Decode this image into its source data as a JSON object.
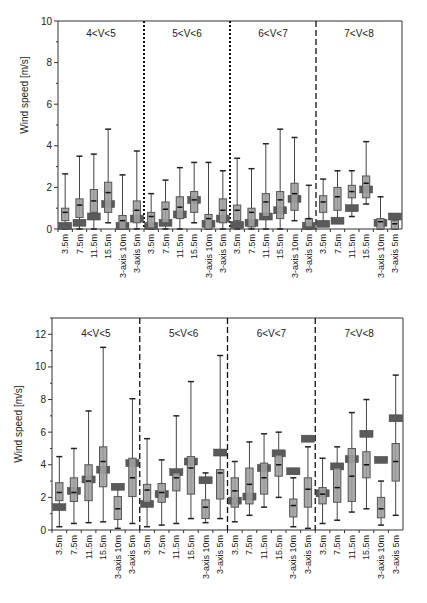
{
  "chart_data": [
    {
      "type": "box",
      "title": "",
      "xlabel": "",
      "ylabel": "Wind speed [m/s]",
      "ylim": [
        0,
        10
      ],
      "yticks": [
        0,
        2,
        4,
        6,
        8,
        10
      ],
      "grid": false,
      "groups": [
        "4<V<5",
        "5<V<6",
        "6<V<7",
        "7<V<8"
      ],
      "categories": [
        "3.5m",
        "7.5m",
        "11.5m",
        "15.5m",
        "3-axis 10m",
        "3-axis 5m"
      ],
      "series": [
        {
          "name": "distribution",
          "description": "light gray boxes: whisker min, q1, median, q3, whisker max",
          "boxes": [
            [
              0.0,
              0.4,
              0.8,
              1.0,
              2.65
            ],
            [
              0.0,
              0.55,
              1.15,
              1.45,
              3.5
            ],
            [
              0.0,
              0.8,
              1.35,
              1.9,
              3.6
            ],
            [
              0.3,
              0.8,
              1.75,
              2.25,
              4.8
            ],
            [
              0.0,
              0.0,
              0.4,
              0.65,
              2.6
            ],
            [
              0.0,
              0.3,
              0.9,
              1.35,
              3.75
            ],
            [
              0.0,
              0.05,
              0.6,
              0.8,
              1.7
            ],
            [
              0.0,
              0.3,
              0.95,
              1.3,
              2.35
            ],
            [
              0.0,
              0.5,
              1.05,
              1.55,
              2.95
            ],
            [
              0.3,
              0.8,
              1.4,
              1.8,
              3.2
            ],
            [
              0.0,
              0.0,
              0.5,
              0.7,
              3.2
            ],
            [
              0.0,
              0.3,
              0.9,
              1.45,
              2.8
            ],
            [
              0.0,
              0.4,
              0.9,
              1.15,
              3.4
            ],
            [
              0.0,
              0.1,
              0.8,
              1.0,
              2.9
            ],
            [
              0.0,
              0.6,
              1.3,
              1.7,
              4.1
            ],
            [
              0.0,
              0.5,
              1.4,
              1.8,
              4.8
            ],
            [
              0.4,
              0.9,
              1.7,
              2.2,
              4.4
            ],
            [
              0.0,
              0.1,
              0.5,
              0.5,
              2.1
            ],
            [
              0.3,
              0.8,
              1.3,
              1.6,
              2.4
            ],
            [
              0.3,
              0.9,
              1.55,
              2.0,
              2.8
            ],
            [
              0.6,
              1.5,
              1.8,
              2.1,
              2.8
            ],
            [
              1.2,
              1.5,
              2.2,
              2.55,
              4.2
            ],
            [
              0.0,
              0.0,
              0.35,
              0.5,
              1.55
            ],
            [
              0.0,
              0.0,
              0.25,
              0.4,
              0.65
            ]
          ]
        },
        {
          "name": "reference",
          "description": "dark gray rectangles (mean marker)",
          "values": [
            0.15,
            0.3,
            0.6,
            1.2,
            0.15,
            0.5,
            0.15,
            0.3,
            0.7,
            1.4,
            0.25,
            0.5,
            0.2,
            0.3,
            0.6,
            0.9,
            1.45,
            0.15,
            0.25,
            0.4,
            1.0,
            1.9,
            0.3,
            0.6
          ]
        }
      ]
    },
    {
      "type": "box",
      "title": "",
      "xlabel": "",
      "ylabel": "Wind speed [m/s]",
      "ylim": [
        0,
        13
      ],
      "yticks": [
        0,
        2,
        4,
        6,
        8,
        10,
        12
      ],
      "grid": false,
      "groups": [
        "4<V<5",
        "5<V<6",
        "6<V<7",
        "7<V<8"
      ],
      "categories": [
        "3.5m",
        "7.5m",
        "11.5m",
        "15.5m",
        "3-axis 10m",
        "3-axis 5m"
      ],
      "series": [
        {
          "name": "distribution",
          "description": "light gray boxes: whisker min, q1, median, q3, whisker max",
          "boxes": [
            [
              0.2,
              1.8,
              2.3,
              2.9,
              4.5
            ],
            [
              0.4,
              1.75,
              2.3,
              3.2,
              5.0
            ],
            [
              0.45,
              1.8,
              3.0,
              4.0,
              7.3
            ],
            [
              0.5,
              2.65,
              4.2,
              5.1,
              11.2
            ],
            [
              0.1,
              0.65,
              1.3,
              2.05,
              2.6
            ],
            [
              0.4,
              2.05,
              3.2,
              4.4,
              8.05
            ],
            [
              0.2,
              1.7,
              2.45,
              2.8,
              5.6
            ],
            [
              0.3,
              1.7,
              2.3,
              2.85,
              4.3
            ],
            [
              0.4,
              2.4,
              3.2,
              3.5,
              7.0
            ],
            [
              0.7,
              2.2,
              3.8,
              4.5,
              9.1
            ],
            [
              0.45,
              0.7,
              1.4,
              1.85,
              3.5
            ],
            [
              0.7,
              1.9,
              3.5,
              3.7,
              10.7
            ],
            [
              0.5,
              1.4,
              2.4,
              3.2,
              4.2
            ],
            [
              0.9,
              1.6,
              2.8,
              3.8,
              5.4
            ],
            [
              1.4,
              2.2,
              3.2,
              4.1,
              5.9
            ],
            [
              2.0,
              3.3,
              4.0,
              4.6,
              6.0
            ],
            [
              0.2,
              0.8,
              1.5,
              1.9,
              3.2
            ],
            [
              0.1,
              1.4,
              2.5,
              3.2,
              5.1
            ],
            [
              0.4,
              1.6,
              2.2,
              2.6,
              4.4
            ],
            [
              0.6,
              1.7,
              2.6,
              3.8,
              5.1
            ],
            [
              1.1,
              1.75,
              3.3,
              5.0,
              7.2
            ],
            [
              1.3,
              3.2,
              4.0,
              4.8,
              8.0
            ],
            [
              0.3,
              0.75,
              1.3,
              2.0,
              3.0
            ],
            [
              0.9,
              3.0,
              4.2,
              5.3,
              9.5
            ]
          ]
        },
        {
          "name": "reference",
          "description": "dark gray rectangles (mean marker)",
          "values": [
            1.4,
            2.4,
            3.1,
            3.7,
            2.65,
            4.1,
            1.6,
            2.2,
            3.55,
            4.2,
            3.05,
            4.75,
            1.8,
            2.05,
            3.8,
            4.7,
            3.6,
            5.6,
            2.25,
            3.9,
            4.35,
            5.9,
            4.3,
            6.85
          ]
        }
      ]
    }
  ],
  "charts": [
    {
      "ylabel": "Wind speed [m/s]",
      "yticks": [
        "0",
        "2",
        "4",
        "6",
        "8",
        "10"
      ],
      "groups": [
        "4<V<5",
        "5<V<6",
        "6<V<7",
        "7<V<8"
      ],
      "categories": [
        "3.5m",
        "7.5m",
        "11.5m",
        "15.5m",
        "3-axis 10m",
        "3-axis 5m"
      ]
    },
    {
      "ylabel": "Wind speed [m/s]",
      "yticks": [
        "0",
        "2",
        "4",
        "6",
        "8",
        "10",
        "12"
      ],
      "groups": [
        "4<V<5",
        "5<V<6",
        "6<V<7",
        "7<V<8"
      ],
      "categories": [
        "3.5m",
        "7.5m",
        "11.5m",
        "15.5m",
        "3-axis 10m",
        "3-axis 5m"
      ]
    }
  ],
  "colors": {
    "box_fill": "#a0a0a0",
    "box_stroke": "#555555",
    "ref_fill": "#5a5a5a",
    "axis": "#333333",
    "text": "#222222"
  }
}
